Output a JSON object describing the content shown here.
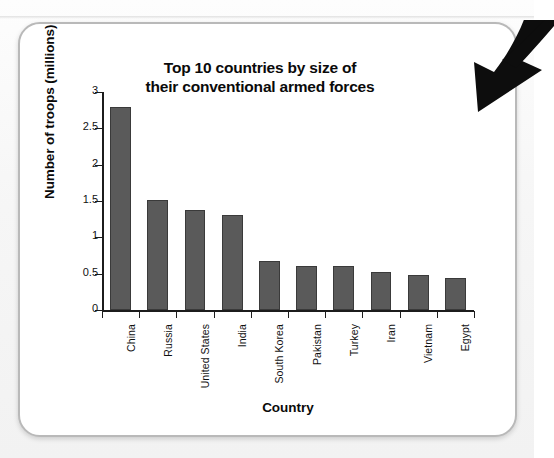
{
  "figure": {
    "title_line1": "Top 10 countries by size of",
    "title_line2": "their conventional armed forces",
    "annotation_icon": "curved-down-arrow-icon",
    "card_border_color": "#b9b9b9",
    "bar_color": "#5a5a5a",
    "bar_edge_color": "#3a3a3a",
    "axis_color": "#1c1c1c"
  },
  "chart_data": {
    "type": "bar",
    "title": "Top 10 countries by size of their conventional armed forces",
    "xlabel": "Country",
    "ylabel": "Number of troops (millions)",
    "categories": [
      "China",
      "Russia",
      "United States",
      "India",
      "South Korea",
      "Pakistan",
      "Turkey",
      "Iran",
      "Vietnam",
      "Egypt"
    ],
    "values": [
      2.8,
      1.52,
      1.37,
      1.31,
      0.68,
      0.61,
      0.61,
      0.52,
      0.48,
      0.44
    ],
    "ylim": [
      0,
      3
    ],
    "ytick_labels": [
      "0",
      "0.5",
      "1",
      "1.5",
      "2",
      "2.5",
      "3"
    ],
    "ytick_values": [
      0,
      0.5,
      1,
      1.5,
      2,
      2.5,
      3
    ],
    "grid": false,
    "legend": false,
    "legend_position": "none",
    "orientation": "vertical",
    "bar_color": "#5a5a5a"
  }
}
